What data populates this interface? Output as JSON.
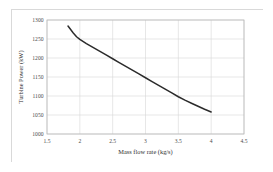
{
  "chart_data": {
    "type": "line",
    "title": "",
    "xlabel": "Mass flow rate (kg/s)",
    "ylabel": "Turbine Power (kW)",
    "xlim": [
      1.5,
      4.5
    ],
    "ylim": [
      1000,
      1300
    ],
    "xticks": [
      "1.5",
      "2",
      "2.5",
      "3",
      "3.5",
      "4",
      "4.5"
    ],
    "xtick_values": [
      1.5,
      2,
      2.5,
      3,
      3.5,
      4,
      4.5
    ],
    "yticks": [
      "1000",
      "1050",
      "1100",
      "1150",
      "1200",
      "1250",
      "1300"
    ],
    "ytick_values": [
      1000,
      1050,
      1100,
      1150,
      1200,
      1250,
      1300
    ],
    "grid": true,
    "legend": false,
    "series": [
      {
        "name": "Turbine Power",
        "color": "#2b2b2b",
        "x": [
          1.82,
          1.86,
          1.9,
          1.95,
          2.0,
          2.1,
          2.2,
          2.3,
          2.4,
          2.5,
          2.6,
          2.7,
          2.8,
          2.9,
          3.0,
          3.1,
          3.2,
          3.3,
          3.4,
          3.5,
          3.6,
          3.7,
          3.8,
          3.9,
          4.0
        ],
        "values": [
          1284,
          1275,
          1266,
          1256,
          1249,
          1238,
          1228,
          1218,
          1208,
          1198,
          1188,
          1178,
          1168,
          1158,
          1148,
          1138,
          1128,
          1118,
          1108,
          1098,
          1089,
          1081,
          1073,
          1065,
          1058
        ]
      }
    ]
  },
  "figure": {
    "background_color": "#ffffff",
    "border_color": "#d9d9d9",
    "grid_color": "#d7d7d7",
    "axis_color": "#b9b9b9"
  }
}
